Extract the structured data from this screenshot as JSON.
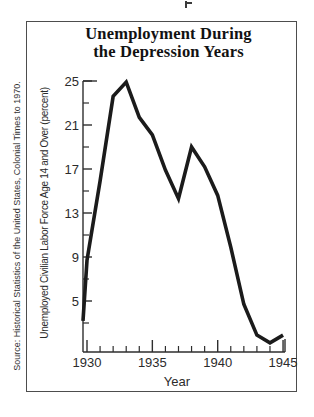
{
  "source_note": "Source: Historical Statistics of the United States, Colonial Times to 1970.",
  "colors": {
    "ink": "#2b2b2b",
    "axis": "#2e2e2e",
    "data_line": "#1b1b1b",
    "frame_border": "#4d4d4d",
    "background": "#ffffff"
  },
  "chart_data": {
    "type": "line",
    "title": "Unemployment During the Depression Years",
    "title_lines": [
      "Unemployment During",
      "the Depression Years"
    ],
    "xlabel": "Year",
    "ylabel": "Unemployed Civilian Labor Force Age 14 and Over (percent)",
    "x": [
      1929,
      1930,
      1931,
      1932,
      1933,
      1934,
      1935,
      1936,
      1937,
      1938,
      1939,
      1940,
      1941,
      1942,
      1943,
      1944,
      1945
    ],
    "values": [
      3.2,
      8.7,
      15.9,
      23.6,
      24.9,
      21.7,
      20.1,
      16.9,
      14.3,
      19.0,
      17.2,
      14.6,
      9.9,
      4.7,
      1.9,
      1.2,
      1.9
    ],
    "x_major_ticks": [
      1930,
      1935,
      1940,
      1945
    ],
    "x_minor_ticks": [
      1931,
      1932,
      1933,
      1934,
      1936,
      1937,
      1938,
      1939,
      1941,
      1942,
      1943,
      1944
    ],
    "y_major_ticks": [
      5,
      9,
      13,
      17,
      21,
      25
    ],
    "y_minor_ticks": [
      3,
      7,
      11,
      15,
      19,
      23
    ],
    "xlim": [
      1929,
      1945
    ],
    "ylim": [
      0,
      25
    ],
    "grid": false,
    "legend": false
  }
}
